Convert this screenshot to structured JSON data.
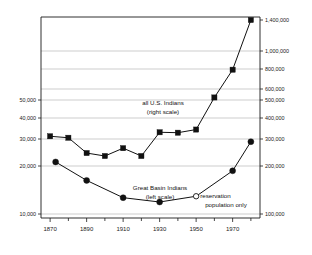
{
  "chart_data": {
    "type": "line",
    "title": "",
    "subtitle": "",
    "xlabel": "",
    "ylabel": "",
    "grid": true,
    "legend_position": "inline-annotations",
    "x": [
      1870,
      1880,
      1890,
      1900,
      1910,
      1920,
      1930,
      1940,
      1950,
      1960,
      1970,
      1980
    ],
    "x_axis": {
      "ticks_major": [
        "1870",
        "1890",
        "1910",
        "1930",
        "1950",
        "1970"
      ],
      "ticks_major_values": [
        1870,
        1890,
        1910,
        1930,
        1950,
        1970
      ],
      "ticks_minor_values": [
        1880,
        1900,
        1920,
        1940,
        1960,
        1980
      ],
      "range": [
        1865,
        1985
      ]
    },
    "left_axis": {
      "name": "Great Basin Indians",
      "tick_labels": [
        "50,000",
        "40,000",
        "30,000",
        "20,000",
        "10,000"
      ],
      "tick_values": [
        50000,
        40000,
        30000,
        20000,
        10000
      ],
      "range": [
        10000,
        50000
      ]
    },
    "right_axis": {
      "name": "all U.S. Indians",
      "tick_labels": [
        "1,400,000",
        "1,000,000",
        "800,000",
        "600,000",
        "500,000",
        "400,000",
        "300,000",
        "200,000",
        "100,000"
      ],
      "tick_values": [
        1400000,
        1000000,
        800000,
        600000,
        500000,
        400000,
        300000,
        200000,
        100000
      ],
      "range": [
        100000,
        1400000
      ]
    },
    "series": [
      {
        "name": "all U.S. Indians",
        "axis": "right",
        "marker": "square",
        "label": "all U.S. Indians",
        "label_sub": "(right scale)",
        "x": [
          1870,
          1880,
          1890,
          1900,
          1910,
          1920,
          1930,
          1940,
          1950,
          1960,
          1970,
          1980
        ],
        "values": [
          313000,
          306000,
          248000,
          237000,
          266000,
          237000,
          332000,
          330000,
          345000,
          523000,
          793000,
          1400000
        ]
      },
      {
        "name": "Great Basin Indians",
        "axis": "left",
        "marker": "circle",
        "label": "Great Basin Indians",
        "label_sub": "(left scale)",
        "x": [
          1873,
          1890,
          1910,
          1930,
          1950,
          1970,
          1980
        ],
        "values": [
          21500,
          17000,
          13400,
          12500,
          13700,
          19000,
          29000
        ],
        "special_point": {
          "x": 1950,
          "value": 13700,
          "marker": "open-circle",
          "annotation_line1": "reservation",
          "annotation_line2": "population only"
        }
      }
    ]
  }
}
